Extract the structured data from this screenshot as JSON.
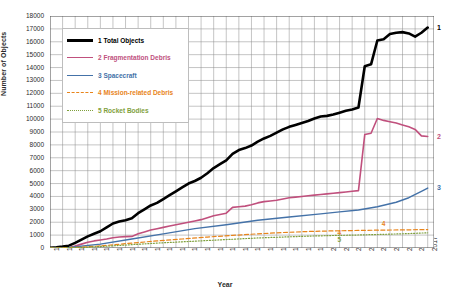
{
  "chart_data": {
    "type": "line",
    "title": "",
    "xlabel": "Year",
    "ylabel": "Number of Objects",
    "xlim": [
      1957,
      2018
    ],
    "ylim": [
      0,
      18000
    ],
    "ytick_step": 1000,
    "xtick_step": 2,
    "grid": true,
    "legend_position": "upper-left-inside",
    "xticks": [
      "1957",
      "1959",
      "1961",
      "1963",
      "1965",
      "1967",
      "1969",
      "1971",
      "1973",
      "1975",
      "1977",
      "1979",
      "1981",
      "1983",
      "1985",
      "1987",
      "1989",
      "1991",
      "1993",
      "1995",
      "1997",
      "1999",
      "2001",
      "2003",
      "2005",
      "2007",
      "2009",
      "2011",
      "2013",
      "2015",
      "2017"
    ],
    "yticks": [
      "0",
      "1000",
      "2000",
      "3000",
      "4000",
      "5000",
      "6000",
      "7000",
      "8000",
      "9000",
      "10000",
      "11000",
      "12000",
      "13000",
      "14000",
      "15000",
      "16000",
      "17000",
      "18000"
    ],
    "series": [
      {
        "index": "1",
        "name": "Total Objects",
        "legend_label": "1 Total Objects",
        "color": "#000000",
        "style": "solid",
        "width": 2.6,
        "end_label": "1",
        "x": [
          1957,
          1958,
          1959,
          1960,
          1961,
          1962,
          1963,
          1964,
          1965,
          1966,
          1967,
          1968,
          1969,
          1970,
          1971,
          1972,
          1973,
          1974,
          1975,
          1976,
          1977,
          1978,
          1979,
          1980,
          1981,
          1982,
          1983,
          1984,
          1985,
          1986,
          1987,
          1988,
          1989,
          1990,
          1991,
          1992,
          1993,
          1994,
          1995,
          1996,
          1997,
          1998,
          1999,
          2000,
          2001,
          2002,
          2003,
          2004,
          2005,
          2006,
          2007,
          2008,
          2009,
          2010,
          2011,
          2012,
          2013,
          2014,
          2015,
          2016,
          2017
        ],
        "y": [
          20,
          60,
          110,
          180,
          400,
          650,
          900,
          1100,
          1300,
          1600,
          1900,
          2050,
          2150,
          2300,
          2700,
          3000,
          3300,
          3500,
          3800,
          4100,
          4400,
          4700,
          5000,
          5200,
          5450,
          5800,
          6200,
          6500,
          6800,
          7300,
          7600,
          7750,
          7950,
          8250,
          8500,
          8700,
          8950,
          9200,
          9400,
          9550,
          9700,
          9850,
          10050,
          10200,
          10250,
          10350,
          10500,
          10650,
          10750,
          10900,
          14100,
          14250,
          16100,
          16200,
          16600,
          16700,
          16750,
          16650,
          16400,
          16700,
          17100
        ]
      },
      {
        "index": "2",
        "name": "Fragmentation Debris",
        "legend_label": "2 Fragmentation Debris",
        "color": "#C0507D",
        "style": "solid",
        "width": 1.6,
        "end_label": "2",
        "x": [
          1957,
          1960,
          1961,
          1962,
          1963,
          1964,
          1965,
          1966,
          1967,
          1968,
          1969,
          1970,
          1971,
          1972,
          1973,
          1974,
          1975,
          1976,
          1977,
          1978,
          1979,
          1980,
          1981,
          1982,
          1983,
          1984,
          1985,
          1986,
          1987,
          1988,
          1989,
          1990,
          1991,
          1992,
          1993,
          1994,
          1995,
          1996,
          1997,
          1998,
          1999,
          2000,
          2001,
          2002,
          2003,
          2004,
          2005,
          2006,
          2007,
          2008,
          2009,
          2010,
          2011,
          2012,
          2013,
          2014,
          2015,
          2016,
          2017
        ],
        "y": [
          0,
          20,
          150,
          300,
          450,
          550,
          620,
          700,
          800,
          850,
          880,
          900,
          1100,
          1250,
          1400,
          1500,
          1600,
          1700,
          1800,
          1900,
          2000,
          2100,
          2200,
          2350,
          2500,
          2600,
          2700,
          3150,
          3200,
          3250,
          3350,
          3500,
          3600,
          3650,
          3700,
          3800,
          3900,
          3950,
          4000,
          4050,
          4100,
          4150,
          4200,
          4250,
          4300,
          4350,
          4400,
          4450,
          8800,
          8900,
          10050,
          9900,
          9800,
          9700,
          9550,
          9400,
          9200,
          8700,
          8650
        ]
      },
      {
        "index": "3",
        "name": "Spacecraft",
        "legend_label": "3 Spacecraft",
        "color": "#4472A8",
        "style": "solid",
        "width": 1.4,
        "end_label": "3",
        "x": [
          1957,
          1960,
          1965,
          1970,
          1975,
          1980,
          1985,
          1990,
          1995,
          2000,
          2003,
          2006,
          2009,
          2012,
          2014,
          2016,
          2017
        ],
        "y": [
          5,
          40,
          300,
          700,
          1100,
          1500,
          1800,
          2150,
          2400,
          2650,
          2800,
          2950,
          3200,
          3550,
          3900,
          4400,
          4650
        ]
      },
      {
        "index": "4",
        "name": "Mission-related Debris",
        "legend_label": "4 Mission-related Debris",
        "color": "#E8841A",
        "style": "dashed",
        "width": 1.2,
        "end_label": "4",
        "x": [
          1957,
          1962,
          1966,
          1970,
          1974,
          1978,
          1982,
          1986,
          1990,
          1994,
          1998,
          2002,
          2006,
          2010,
          2014,
          2017
        ],
        "y": [
          0,
          60,
          200,
          380,
          550,
          700,
          850,
          980,
          1100,
          1200,
          1280,
          1330,
          1360,
          1390,
          1410,
          1430
        ]
      },
      {
        "index": "5",
        "name": "Rocket Bodies",
        "legend_label": "5 Rocket Bodies",
        "color": "#7FA03C",
        "style": "dotted",
        "width": 1.2,
        "end_label": "5",
        "x": [
          1957,
          1962,
          1966,
          1970,
          1974,
          1978,
          1982,
          1986,
          1990,
          1994,
          1998,
          2002,
          2006,
          2010,
          2014,
          2017
        ],
        "y": [
          2,
          40,
          140,
          260,
          380,
          480,
          580,
          680,
          780,
          850,
          920,
          970,
          1010,
          1060,
          1120,
          1180
        ]
      }
    ],
    "annotations": [
      {
        "text": "1",
        "series": "1",
        "position": "right-edge"
      },
      {
        "text": "2",
        "series": "2",
        "position": "right-edge"
      },
      {
        "text": "3",
        "series": "3",
        "position": "right-edge"
      },
      {
        "text": "4",
        "series": "4",
        "position": "inside-right"
      },
      {
        "text": "5",
        "series": "5",
        "position": "inside-center"
      }
    ],
    "colors": {
      "grid": "#8a8a8a",
      "axis": "#555555",
      "background": "#ffffff",
      "text": "#2b2b2b"
    }
  }
}
